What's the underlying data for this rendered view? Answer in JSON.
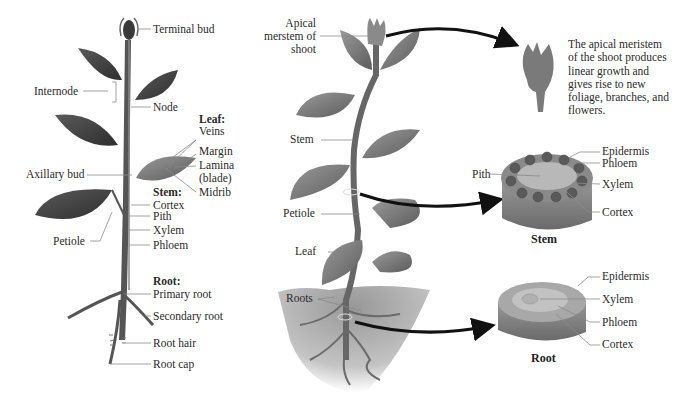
{
  "left_plant": {
    "labels": {
      "terminal_bud": "Terminal bud",
      "internode": "Internode",
      "node": "Node",
      "leaf_heading": "Leaf:",
      "veins": "Veins",
      "margin": "Margin",
      "lamina": "Lamina",
      "blade": "(blade)",
      "midrib": "Midrib",
      "axillary_bud": "Axillary bud",
      "stem_heading": "Stem:",
      "cortex": "Cortex",
      "pith": "Pith",
      "xylem": "Xylem",
      "phloem": "Phloem",
      "petiole": "Petiole",
      "root_heading": "Root:",
      "primary_root": "Primary root",
      "secondary_root": "Secondary root",
      "root_hair": "Root hair",
      "root_cap": "Root cap"
    }
  },
  "middle_plant": {
    "labels": {
      "apical_1": "Apical",
      "apical_2": "merstem of",
      "apical_3": "shoot",
      "stem": "Stem",
      "petiole": "Petiole",
      "leaf": "Leaf",
      "roots": "Roots"
    }
  },
  "apical_detail": {
    "description_lines": [
      "The apical meristem",
      "of the shoot produces",
      "linear growth and",
      "gives rise to new",
      "foliage, branches, and",
      "flowers."
    ]
  },
  "stem_section": {
    "caption": "Stem",
    "labels": {
      "epidermis": "Epidermis",
      "phloem": "Phloem",
      "pith": "Pith",
      "xylem": "Xylem",
      "cortex": "Cortex"
    }
  },
  "root_section": {
    "caption": "Root",
    "labels": {
      "epidermis": "Epidermis",
      "xylem": "Xylem",
      "phloem": "Phloem",
      "cortex": "Cortex"
    }
  },
  "colors": {
    "leaf_dark": "#4a4a4a",
    "leaf_mid": "#7a7a7a",
    "stem": "#5a5a5a",
    "soil": "#9a9a9a",
    "leader": "#8a8a8a",
    "arrow": "#111111"
  }
}
